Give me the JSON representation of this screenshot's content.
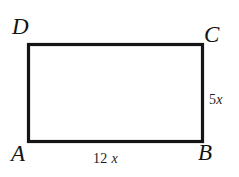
{
  "figure": {
    "kind": "geometry-diagram",
    "shape": "rectangle",
    "stroke_color": "#151515",
    "background_color": "#ffffff",
    "stroke_width_px": 3,
    "vertices": [
      {
        "id": "D",
        "label": "D",
        "position": "top-left"
      },
      {
        "id": "C",
        "label": "C",
        "position": "top-right"
      },
      {
        "id": "A",
        "label": "A",
        "position": "bottom-left"
      },
      {
        "id": "B",
        "label": "B",
        "position": "bottom-right"
      }
    ],
    "side_labels": [
      {
        "id": "AB",
        "label": "12 x",
        "number": "12",
        "variable": "x",
        "side": "bottom"
      },
      {
        "id": "BC",
        "label": "5x",
        "number": "5",
        "variable": "x",
        "side": "right"
      }
    ]
  }
}
